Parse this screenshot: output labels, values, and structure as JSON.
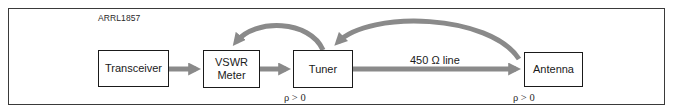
{
  "figure": {
    "id_label": "ARRL1857",
    "arrow_color": "#8a8a8a",
    "border_color": "#3a3a3a"
  },
  "blocks": {
    "transceiver": {
      "label": "Transceiver"
    },
    "vswr_meter": {
      "line1": "VSWR",
      "line2": "Meter"
    },
    "tuner": {
      "label": "Tuner"
    },
    "antenna": {
      "label": "Antenna"
    }
  },
  "connections": {
    "feed_line_label": "450 Ω line",
    "forward": [
      {
        "from": "Transceiver",
        "to": "VSWR Meter"
      },
      {
        "from": "VSWR Meter",
        "to": "Tuner"
      },
      {
        "from": "Tuner",
        "to": "Antenna"
      }
    ],
    "reflected": [
      {
        "from": "Tuner",
        "to": "VSWR Meter"
      },
      {
        "from": "Antenna",
        "to": "Tuner"
      }
    ]
  },
  "annotations": {
    "tuner_reflection": "ρ > 0",
    "antenna_reflection": "ρ > 0"
  }
}
